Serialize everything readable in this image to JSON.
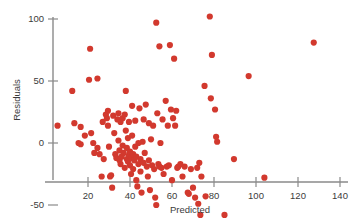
{
  "chart_data": {
    "type": "scatter",
    "title": "",
    "xlabel": "Predicted",
    "ylabel": "Residuals",
    "xlim": [
      0,
      148
    ],
    "ylim": [
      -65,
      112
    ],
    "xticks": [
      20,
      40,
      60,
      80,
      100,
      120,
      140
    ],
    "xtick_labels": [
      "20",
      "40",
      "60",
      "80",
      "100",
      "120",
      "140"
    ],
    "yticks": [
      -50,
      0,
      50,
      100
    ],
    "ytick_labels": [
      "-50",
      "0",
      "50",
      "100"
    ],
    "grid": false,
    "legend": false,
    "marker_color": "#d2392e",
    "marker_size": 3.1,
    "axis_color": "#8a8a8a",
    "points": [
      [
        5.5,
        14
      ],
      [
        12.5,
        42
      ],
      [
        13.5,
        16
      ],
      [
        15.5,
        0
      ],
      [
        16.5,
        13
      ],
      [
        16.5,
        -1
      ],
      [
        18.5,
        6
      ],
      [
        20.5,
        51
      ],
      [
        21.0,
        76
      ],
      [
        21.5,
        8
      ],
      [
        22.5,
        0
      ],
      [
        23.0,
        -8
      ],
      [
        24.5,
        52
      ],
      [
        24.5,
        -4
      ],
      [
        25.5,
        -9
      ],
      [
        26.5,
        -27
      ],
      [
        27.0,
        17
      ],
      [
        27.5,
        -13
      ],
      [
        28.5,
        23
      ],
      [
        29.0,
        20
      ],
      [
        29.5,
        26
      ],
      [
        29.5,
        14
      ],
      [
        30.0,
        -3
      ],
      [
        30.5,
        -27
      ],
      [
        31.0,
        -26
      ],
      [
        31.5,
        -36
      ],
      [
        32.0,
        22
      ],
      [
        32.5,
        8
      ],
      [
        33.0,
        -9
      ],
      [
        33.5,
        -12
      ],
      [
        34.0,
        19
      ],
      [
        34.5,
        24
      ],
      [
        34.5,
        2
      ],
      [
        35.0,
        -6
      ],
      [
        35.0,
        -14
      ],
      [
        35.5,
        17
      ],
      [
        35.5,
        -17
      ],
      [
        36.0,
        -11
      ],
      [
        36.5,
        20
      ],
      [
        36.5,
        -2
      ],
      [
        37.0,
        -8
      ],
      [
        37.5,
        23
      ],
      [
        37.5,
        -20
      ],
      [
        38.0,
        42
      ],
      [
        38.0,
        10
      ],
      [
        38.5,
        -4
      ],
      [
        38.5,
        -13
      ],
      [
        39.0,
        4
      ],
      [
        39.0,
        -15
      ],
      [
        39.5,
        17
      ],
      [
        39.5,
        -10
      ],
      [
        40.0,
        -7
      ],
      [
        40.0,
        -18
      ],
      [
        40.5,
        -12
      ],
      [
        40.5,
        -25
      ],
      [
        41.0,
        30
      ],
      [
        41.0,
        6
      ],
      [
        41.5,
        -9
      ],
      [
        41.5,
        -21
      ],
      [
        42.0,
        -14
      ],
      [
        42.5,
        18
      ],
      [
        42.5,
        -3
      ],
      [
        43.0,
        -11
      ],
      [
        43.0,
        -30
      ],
      [
        43.5,
        -35
      ],
      [
        44.0,
        0
      ],
      [
        44.0,
        -17
      ],
      [
        44.5,
        28
      ],
      [
        45.0,
        -13
      ],
      [
        45.0,
        -23
      ],
      [
        45.5,
        -40
      ],
      [
        46.0,
        1
      ],
      [
        46.5,
        19
      ],
      [
        46.5,
        -16
      ],
      [
        47.0,
        -8
      ],
      [
        47.5,
        31
      ],
      [
        48.0,
        -19
      ],
      [
        48.5,
        -27
      ],
      [
        49.0,
        16
      ],
      [
        49.0,
        -14
      ],
      [
        49.5,
        -38
      ],
      [
        50.0,
        3
      ],
      [
        50.5,
        -18
      ],
      [
        51.0,
        14
      ],
      [
        51.5,
        -21
      ],
      [
        52.0,
        -44
      ],
      [
        52.5,
        97
      ],
      [
        52.5,
        -50
      ],
      [
        53.0,
        24
      ],
      [
        53.5,
        -17
      ],
      [
        54.0,
        78
      ],
      [
        54.0,
        -19
      ],
      [
        54.5,
        0
      ],
      [
        55.0,
        -20
      ],
      [
        55.5,
        19
      ],
      [
        56.0,
        -25
      ],
      [
        57.0,
        34
      ],
      [
        57.5,
        -19
      ],
      [
        58.0,
        14
      ],
      [
        58.5,
        -18
      ],
      [
        59.0,
        79
      ],
      [
        59.5,
        27
      ],
      [
        60.0,
        -30
      ],
      [
        60.5,
        20
      ],
      [
        61.0,
        68
      ],
      [
        61.5,
        14
      ],
      [
        62.0,
        26
      ],
      [
        62.5,
        -20
      ],
      [
        63.0,
        -19
      ],
      [
        64.0,
        -17
      ],
      [
        65.0,
        -27
      ],
      [
        66.0,
        -19
      ],
      [
        67.5,
        -40
      ],
      [
        68.0,
        -41
      ],
      [
        69.0,
        -21
      ],
      [
        70.0,
        -36
      ],
      [
        71.0,
        -44
      ],
      [
        72.0,
        -20
      ],
      [
        72.5,
        -49
      ],
      [
        73.0,
        -16
      ],
      [
        73.5,
        -58
      ],
      [
        74.0,
        -27
      ],
      [
        75.5,
        46
      ],
      [
        76.0,
        -43
      ],
      [
        78.0,
        102
      ],
      [
        78.5,
        36
      ],
      [
        79.0,
        71
      ],
      [
        80.5,
        27
      ],
      [
        81.0,
        5
      ],
      [
        81.5,
        1
      ],
      [
        85.0,
        -58
      ],
      [
        89.5,
        -13
      ],
      [
        96.5,
        54
      ],
      [
        104.0,
        -28
      ],
      [
        127.5,
        81
      ]
    ]
  }
}
